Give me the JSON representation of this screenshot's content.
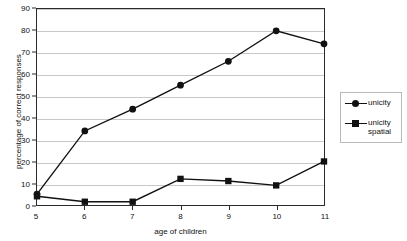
{
  "chart_data": {
    "type": "line",
    "title": "",
    "xlabel": "age of children",
    "ylabel": "percentage of correct responses",
    "x": [
      5,
      6,
      7,
      8,
      9,
      10,
      11
    ],
    "xticklabels": [
      "5",
      "6",
      "7",
      "8",
      "9",
      "10",
      "11"
    ],
    "xlim": [
      5,
      11
    ],
    "ylim": [
      0,
      90
    ],
    "yticks": [
      0,
      10,
      20,
      30,
      40,
      50,
      60,
      70,
      80,
      90
    ],
    "yticklabels": [
      "0",
      "10",
      "20",
      "30",
      "40",
      "50",
      "60",
      "70",
      "80",
      "90"
    ],
    "grid": "horizontal",
    "legend_position": "right-outside",
    "series": [
      {
        "name": "unicity",
        "marker": "circle",
        "color": "#111111",
        "values": [
          5,
          34,
          44,
          55,
          66,
          80,
          74
        ]
      },
      {
        "name": "unicity spatial",
        "marker": "square",
        "color": "#111111",
        "values": [
          4,
          1.5,
          1.5,
          12,
          11,
          9,
          20
        ]
      }
    ]
  },
  "legend": {
    "entries": [
      {
        "label": "unicity",
        "marker": "circle"
      },
      {
        "label": "unicity spatial",
        "marker": "square"
      }
    ]
  },
  "colors": {
    "line": "#111111",
    "marker": "#111111",
    "gridline": "#c8c8c8",
    "axis": "#2b2b2b",
    "legend_border": "#b9b9b9",
    "background": "#ffffff"
  }
}
